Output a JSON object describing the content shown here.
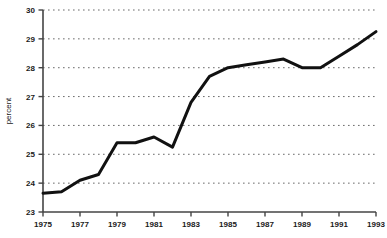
{
  "chart_data": {
    "type": "line",
    "title": "",
    "subtitle": "",
    "xlabel": "",
    "ylabel": "percent",
    "xlim": [
      1975,
      1993
    ],
    "ylim": [
      23,
      30
    ],
    "grid": true,
    "grid_axis": "y",
    "grid_style": "dashed",
    "legend": false,
    "legend_position": "none",
    "line_color": "#111111",
    "line_width": 3,
    "axis_color": "#444444",
    "x": [
      1975,
      1976,
      1977,
      1978,
      1979,
      1980,
      1981,
      1982,
      1983,
      1984,
      1985,
      1986,
      1987,
      1988,
      1989,
      1990,
      1991,
      1992,
      1993
    ],
    "values": [
      23.65,
      23.7,
      24.1,
      24.3,
      25.4,
      25.4,
      25.6,
      25.25,
      26.8,
      27.7,
      28.0,
      28.1,
      28.2,
      28.3,
      28.0,
      28.0,
      28.4,
      28.8,
      29.25
    ],
    "xticks": [
      1975,
      1977,
      1979,
      1981,
      1983,
      1985,
      1987,
      1989,
      1991,
      1993
    ],
    "xtick_labels": [
      "1975",
      "1977",
      "1979",
      "1981",
      "1983",
      "1985",
      "1987",
      "1989",
      "1991",
      "1993"
    ],
    "yticks": [
      23,
      24,
      25,
      26,
      27,
      28,
      29,
      30
    ],
    "ytick_labels": [
      "23",
      "24",
      "25",
      "26",
      "27",
      "28",
      "29",
      "30"
    ],
    "series": [
      {
        "name": "percent",
        "values": [
          23.65,
          23.7,
          24.1,
          24.3,
          25.4,
          25.4,
          25.6,
          25.25,
          26.8,
          27.7,
          28.0,
          28.1,
          28.2,
          28.3,
          28.0,
          28.0,
          28.4,
          28.8,
          29.25
        ]
      }
    ]
  }
}
